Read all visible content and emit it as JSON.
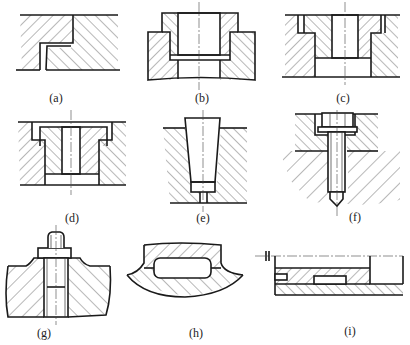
{
  "figure": {
    "line_color": "#1a1a1a",
    "background": "#ffffff",
    "panels": [
      {
        "id": "a",
        "caption": "(a)",
        "content": "Stepped lap joint between two hatched plates"
      },
      {
        "id": "b",
        "caption": "(b)",
        "content": "Flanged bushing press-fitted in stepped bore, centerline"
      },
      {
        "id": "c",
        "caption": "(c)",
        "content": "Shouldered bushing in counterbored plate, centerline"
      },
      {
        "id": "d",
        "caption": "(d)",
        "content": "Headed bushing with retaining groove in plate, centerline"
      },
      {
        "id": "e",
        "caption": "(e)",
        "content": "Tapered pin in tapered hole with small vent bore"
      },
      {
        "id": "f",
        "caption": "(f)",
        "content": "Socket-head cap screw through counterbored plate into base"
      },
      {
        "id": "g",
        "caption": "(g)",
        "content": "Stud with nut clamping through raised boss"
      },
      {
        "id": "h",
        "caption": "(h)",
        "content": "Curved casting with enclosed elongated cavity"
      },
      {
        "id": "i",
        "caption": "(i)",
        "content": "Layered plates with slot and embedded key, break line"
      }
    ]
  }
}
